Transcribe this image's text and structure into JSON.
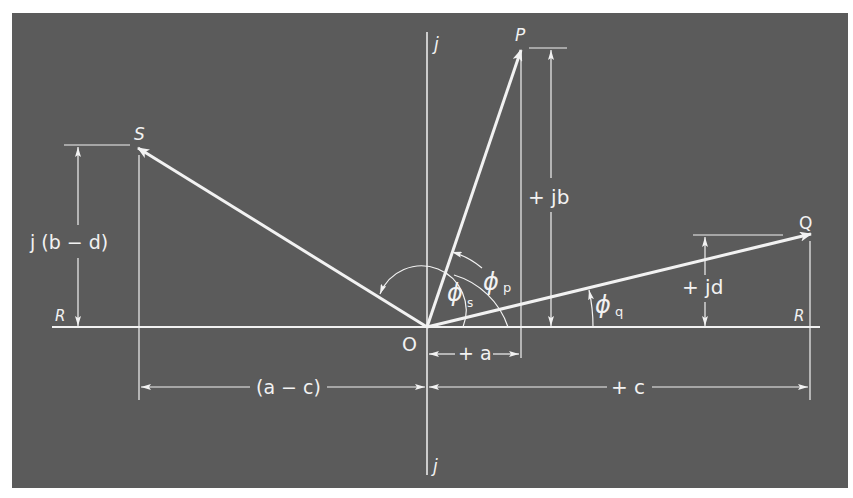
{
  "diagram": {
    "colors": {
      "page_background": "#ffffff",
      "panel_background": "#5b5b5b",
      "line_color": "#f2f2f2"
    },
    "axes": {
      "real_axis_label_left": "R",
      "real_axis_label_right": "R",
      "imag_axis_label_top": "j",
      "imag_axis_label_bottom": "j",
      "origin_label": "O"
    },
    "vectors": [
      {
        "id": "P",
        "label": "P"
      },
      {
        "id": "Q",
        "label": "Q"
      },
      {
        "id": "S",
        "label": "S"
      }
    ],
    "angles": {
      "phi_s": {
        "symbol": "ϕ",
        "subscript": "s"
      },
      "phi_p": {
        "symbol": "ϕ",
        "subscript": "p"
      },
      "phi_q": {
        "symbol": "ϕ",
        "subscript": "q"
      }
    },
    "dimensions": {
      "plus_jb": "+ jb",
      "plus_jd": "+ jd",
      "j_b_minus_d": "j (b − d)",
      "plus_a": "+ a",
      "a_minus_c": "(a − c)",
      "plus_c": "+ c"
    }
  }
}
